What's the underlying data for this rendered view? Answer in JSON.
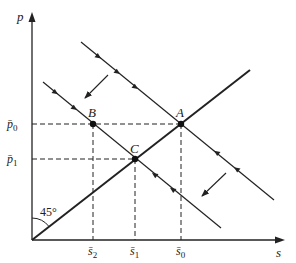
{
  "axes": {
    "y_label": "p",
    "x_label": "s"
  },
  "points": [
    {
      "name": "A",
      "x": 181,
      "y": 124
    },
    {
      "name": "B",
      "x": 93,
      "y": 124
    },
    {
      "name": "C",
      "x": 135,
      "y": 159
    }
  ],
  "y_ticks": [
    {
      "label": "p̄",
      "sub": "0",
      "y": 124
    },
    {
      "label": "p̄",
      "sub": "1",
      "y": 159
    }
  ],
  "x_ticks": [
    {
      "label": "s̄",
      "sub": "2",
      "x": 93
    },
    {
      "label": "s̄",
      "sub": "1",
      "x": 135
    },
    {
      "label": "s̄",
      "sub": "0",
      "x": 181
    }
  ],
  "angle_label": "45°",
  "colors": {
    "ink": "#222222"
  }
}
